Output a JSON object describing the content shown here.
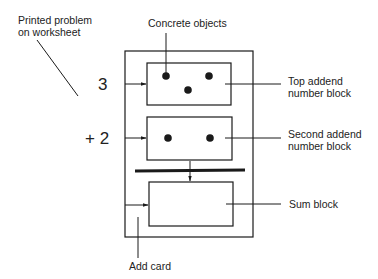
{
  "labels": {
    "printed_problem_line1": "Printed problem",
    "printed_problem_line2": "on worksheet",
    "concrete_objects": "Concrete objects",
    "top_addend_line1": "Top addend",
    "top_addend_line2": "number block",
    "second_addend_line1": "Second addend",
    "second_addend_line2": "number block",
    "sum_block": "Sum block",
    "add_card": "Add card"
  },
  "problem": {
    "top_number": "3",
    "second_number": "+ 2"
  },
  "blocks": {
    "top_dots": 3,
    "second_dots": 2,
    "sum_dots": 0
  },
  "colors": {
    "ink": "#1a1a1a",
    "background": "#ffffff"
  }
}
